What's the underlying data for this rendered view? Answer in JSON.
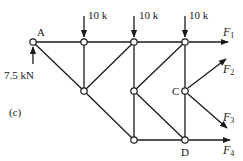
{
  "figure": {
    "panel_label": "(c)"
  },
  "nodes": {
    "A": {
      "label": "A",
      "x": 33,
      "y": 42
    },
    "T1": {
      "label": "",
      "x": 84,
      "y": 42
    },
    "T2": {
      "label": "",
      "x": 134,
      "y": 42
    },
    "T3": {
      "label": "",
      "x": 185,
      "y": 42
    },
    "M1": {
      "label": "",
      "x": 84,
      "y": 91
    },
    "M2": {
      "label": "",
      "x": 134,
      "y": 91
    },
    "C": {
      "label": "C",
      "x": 185,
      "y": 91
    },
    "B1": {
      "label": "",
      "x": 134,
      "y": 140
    },
    "D": {
      "label": "D",
      "x": 185,
      "y": 140
    }
  },
  "members": [
    [
      "A",
      "T1"
    ],
    [
      "T1",
      "T2"
    ],
    [
      "T2",
      "T3"
    ],
    [
      "A",
      "M1"
    ],
    [
      "T1",
      "M1"
    ],
    [
      "T2",
      "M1"
    ],
    [
      "T2",
      "M2"
    ],
    [
      "M2",
      "B1"
    ],
    [
      "M1",
      "B1"
    ],
    [
      "T3",
      "M2"
    ],
    [
      "T3",
      "C"
    ],
    [
      "C",
      "D"
    ],
    [
      "M2",
      "D"
    ],
    [
      "B1",
      "D"
    ]
  ],
  "loads": [
    {
      "node": "T1",
      "label": "10 k",
      "direction": "down"
    },
    {
      "node": "T2",
      "label": "10 k",
      "direction": "down"
    },
    {
      "node": "T3",
      "label": "10 k",
      "direction": "down"
    },
    {
      "node": "A",
      "label": "7.5 kN",
      "direction": "up"
    }
  ],
  "unknown_forces": [
    {
      "node": "T3",
      "symbol": "F",
      "subscript": "1",
      "direction": "right"
    },
    {
      "node": "C",
      "symbol": "F",
      "subscript": "2",
      "direction": "up-right"
    },
    {
      "node": "C",
      "symbol": "F",
      "subscript": "3",
      "direction": "down-right"
    },
    {
      "node": "D",
      "symbol": "F",
      "subscript": "4",
      "direction": "right"
    }
  ],
  "labels": {
    "node_A": "A",
    "node_C": "C",
    "node_D": "D",
    "load_1": "10 k",
    "load_2": "10 k",
    "load_3": "10 k",
    "reaction_A": "7.5 kN",
    "F": "F",
    "F1_sub": "1",
    "F2_sub": "2",
    "F3_sub": "3",
    "F4_sub": "4",
    "panel": "(c)"
  }
}
